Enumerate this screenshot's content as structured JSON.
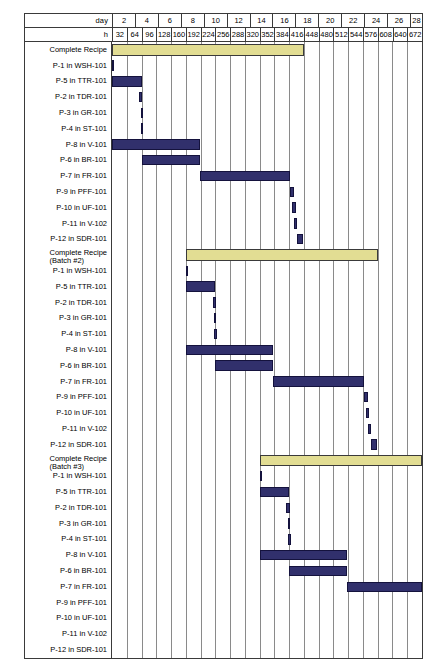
{
  "chart_data": {
    "type": "gantt",
    "title": "",
    "xlabel_day": "day",
    "xlabel_hour": "h",
    "axis": {
      "hour_min": 0,
      "hour_max": 672,
      "hour_step": 32,
      "day_min": 0,
      "day_max": 28,
      "day_step": 2,
      "grid": true
    },
    "day_ticks": [
      2,
      4,
      6,
      8,
      10,
      12,
      14,
      16,
      18,
      20,
      22,
      24,
      26,
      28
    ],
    "hour_ticks": [
      32,
      64,
      96,
      128,
      160,
      192,
      224,
      256,
      288,
      320,
      352,
      384,
      416,
      448,
      480,
      512,
      544,
      576,
      608,
      640,
      672
    ],
    "colors": {
      "summary_bar": "#e2dd93",
      "task_bar": "#31306c",
      "task_bar_border": "#14123d",
      "grid": "#8a8a8a",
      "frame": "#3a3a3a",
      "background": "#ffffff",
      "text": "#000000"
    },
    "rows": [
      {
        "label": "Complete Recipe",
        "label_line2": "",
        "kind": "summary",
        "start_h": 0,
        "end_h": 416
      },
      {
        "label": "P-1 in WSH-101",
        "label_line2": "",
        "kind": "task",
        "start_h": 0,
        "end_h": 2
      },
      {
        "label": "P-5 in TTR-101",
        "label_line2": "",
        "kind": "task",
        "start_h": 0,
        "end_h": 64
      },
      {
        "label": "P-2 in TDR-101",
        "label_line2": "",
        "kind": "task",
        "start_h": 58,
        "end_h": 66
      },
      {
        "label": "P-3 in GR-101",
        "label_line2": "",
        "kind": "task",
        "start_h": 62,
        "end_h": 66
      },
      {
        "label": "P-4 in ST-101",
        "label_line2": "",
        "kind": "task",
        "start_h": 62,
        "end_h": 68
      },
      {
        "label": "P-8 in V-101",
        "label_line2": "",
        "kind": "task",
        "start_h": 0,
        "end_h": 190
      },
      {
        "label": "P-6 in BR-101",
        "label_line2": "",
        "kind": "task",
        "start_h": 64,
        "end_h": 190
      },
      {
        "label": "P-7 in FR-101",
        "label_line2": "",
        "kind": "task",
        "start_h": 190,
        "end_h": 386
      },
      {
        "label": "P-9 in PFF-101",
        "label_line2": "",
        "kind": "task",
        "start_h": 386,
        "end_h": 394
      },
      {
        "label": "P-10 in UF-101",
        "label_line2": "",
        "kind": "task",
        "start_h": 390,
        "end_h": 398
      },
      {
        "label": "P-11 in V-102",
        "label_line2": "",
        "kind": "task",
        "start_h": 394,
        "end_h": 402
      },
      {
        "label": "P-12 in SDR-101",
        "label_line2": "",
        "kind": "task",
        "start_h": 402,
        "end_h": 414
      },
      {
        "label": "Complete Recipe",
        "label_line2": "(Batch #2)",
        "kind": "summary",
        "start_h": 160,
        "end_h": 576
      },
      {
        "label": "P-1 in WSH-101",
        "label_line2": "",
        "kind": "task",
        "start_h": 160,
        "end_h": 162
      },
      {
        "label": "P-5 in TTR-101",
        "label_line2": "",
        "kind": "task",
        "start_h": 160,
        "end_h": 224
      },
      {
        "label": "P-2 in TDR-101",
        "label_line2": "",
        "kind": "task",
        "start_h": 218,
        "end_h": 226
      },
      {
        "label": "P-3 in GR-101",
        "label_line2": "",
        "kind": "task",
        "start_h": 222,
        "end_h": 226
      },
      {
        "label": "P-4 in ST-101",
        "label_line2": "",
        "kind": "task",
        "start_h": 222,
        "end_h": 228
      },
      {
        "label": "P-8 in V-101",
        "label_line2": "",
        "kind": "task",
        "start_h": 160,
        "end_h": 350
      },
      {
        "label": "P-6 in BR-101",
        "label_line2": "",
        "kind": "task",
        "start_h": 224,
        "end_h": 350
      },
      {
        "label": "P-7 in FR-101",
        "label_line2": "",
        "kind": "task",
        "start_h": 350,
        "end_h": 546
      },
      {
        "label": "P-9 in PFF-101",
        "label_line2": "",
        "kind": "task",
        "start_h": 546,
        "end_h": 554
      },
      {
        "label": "P-10 in UF-101",
        "label_line2": "",
        "kind": "task",
        "start_h": 550,
        "end_h": 558
      },
      {
        "label": "P-11 in V-102",
        "label_line2": "",
        "kind": "task",
        "start_h": 554,
        "end_h": 562
      },
      {
        "label": "P-12 in SDR-101",
        "label_line2": "",
        "kind": "task",
        "start_h": 562,
        "end_h": 574
      },
      {
        "label": "Complete Recipe",
        "label_line2": "(Batch #3)",
        "kind": "summary",
        "start_h": 320,
        "end_h": 736
      },
      {
        "label": "P-1 in WSH-101",
        "label_line2": "",
        "kind": "task",
        "start_h": 320,
        "end_h": 322
      },
      {
        "label": "P-5 in TTR-101",
        "label_line2": "",
        "kind": "task",
        "start_h": 320,
        "end_h": 384
      },
      {
        "label": "P-2 in TDR-101",
        "label_line2": "",
        "kind": "task",
        "start_h": 378,
        "end_h": 386
      },
      {
        "label": "P-3 in GR-101",
        "label_line2": "",
        "kind": "task",
        "start_h": 382,
        "end_h": 386
      },
      {
        "label": "P-4 in ST-101",
        "label_line2": "",
        "kind": "task",
        "start_h": 382,
        "end_h": 388
      },
      {
        "label": "P-8 in V-101",
        "label_line2": "",
        "kind": "task",
        "start_h": 320,
        "end_h": 510
      },
      {
        "label": "P-6 in BR-101",
        "label_line2": "",
        "kind": "task",
        "start_h": 384,
        "end_h": 510
      },
      {
        "label": "P-7 in FR-101",
        "label_line2": "",
        "kind": "task",
        "start_h": 510,
        "end_h": 706
      },
      {
        "label": "P-9 in PFF-101",
        "label_line2": "",
        "kind": "task",
        "start_h": 706,
        "end_h": 714
      },
      {
        "label": "P-10 in UF-101",
        "label_line2": "",
        "kind": "task",
        "start_h": 710,
        "end_h": 718
      },
      {
        "label": "P-11 in V-102",
        "label_line2": "",
        "kind": "task",
        "start_h": 714,
        "end_h": 722
      },
      {
        "label": "P-12 in SDR-101",
        "label_line2": "",
        "kind": "task",
        "start_h": 722,
        "end_h": 734
      }
    ]
  }
}
